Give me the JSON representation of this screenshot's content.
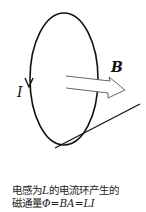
{
  "diagram": {
    "labels": {
      "current": "I",
      "field": "B"
    },
    "caption": {
      "line1_prefix": "电感为",
      "line1_var": "L",
      "line1_suffix": "的电流环产生的",
      "line2_prefix": "磁通量",
      "line2_formula": "Φ=BA=LI"
    },
    "colors": {
      "stroke": "#111111",
      "arrow_fill": "#ffffff"
    }
  }
}
